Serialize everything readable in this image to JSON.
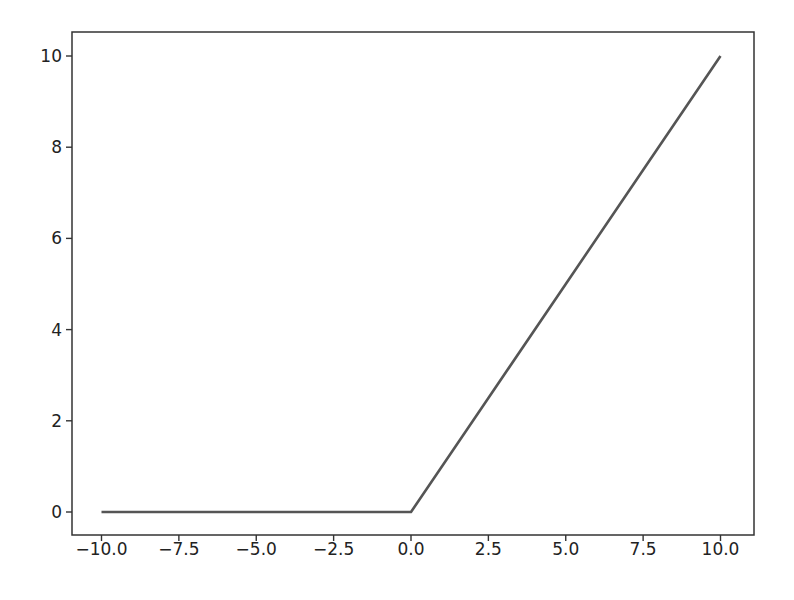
{
  "chart_data": {
    "type": "line",
    "title": "",
    "xlabel": "",
    "ylabel": "",
    "xlim": [
      -11.0,
      11.0
    ],
    "ylim": [
      -0.5,
      10.5
    ],
    "grid": false,
    "legend": null,
    "x_ticks": [
      -10.0,
      -7.5,
      -5.0,
      -2.5,
      0.0,
      2.5,
      5.0,
      7.5,
      10.0
    ],
    "x_tick_labels": [
      "−10.0",
      "−7.5",
      "−5.0",
      "−2.5",
      "0.0",
      "2.5",
      "5.0",
      "7.5",
      "10.0"
    ],
    "y_ticks": [
      0,
      2,
      4,
      6,
      8,
      10
    ],
    "y_tick_labels": [
      "0",
      "2",
      "4",
      "6",
      "8",
      "10"
    ],
    "series": [
      {
        "name": "relu",
        "color": "#555555",
        "x": [
          -10.0,
          -7.5,
          -5.0,
          -2.5,
          0.0,
          2.5,
          5.0,
          7.5,
          10.0
        ],
        "y": [
          0,
          0,
          0,
          0,
          0,
          2.5,
          5.0,
          7.5,
          10.0
        ]
      }
    ]
  },
  "colors": {
    "background": "#ffffff",
    "axes": "#333333",
    "line": "#555555",
    "text": "#222222"
  }
}
